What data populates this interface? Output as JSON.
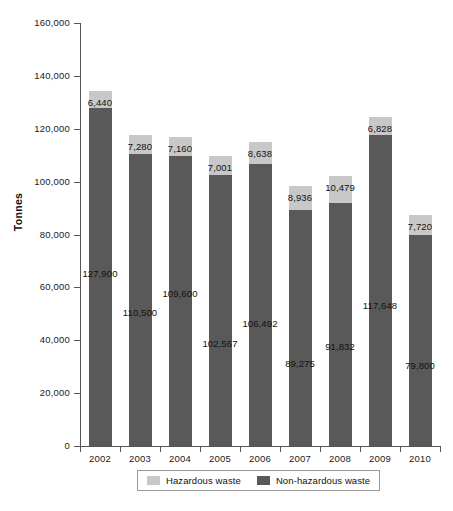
{
  "chart_data": {
    "type": "bar",
    "stacked": true,
    "title": "",
    "subtitle": "",
    "xlabel": "",
    "ylabel": "Tonnes",
    "ylim": [
      0,
      160000
    ],
    "ytick_values": [
      0,
      20000,
      40000,
      60000,
      80000,
      100000,
      120000,
      140000,
      160000
    ],
    "ytick_labels": [
      "0",
      "20,000",
      "40,000",
      "60,000",
      "80,000",
      "100,000",
      "120,000",
      "140,000",
      "160,000"
    ],
    "grid": false,
    "legend_position": "bottom",
    "categories": [
      "2002",
      "2003",
      "2004",
      "2005",
      "2006",
      "2007",
      "2008",
      "2009",
      "2010"
    ],
    "series": [
      {
        "name": "Non-hazardous waste",
        "color": "#595959",
        "values": [
          127900,
          110500,
          109600,
          102567,
          106492,
          89275,
          91832,
          117648,
          79800
        ],
        "labels": [
          "127,900",
          "110,500",
          "109,600",
          "102,567",
          "106,492",
          "89,275",
          "91,832",
          "117,648",
          "79,800"
        ]
      },
      {
        "name": "Hazardous waste",
        "color": "#c8c8c8",
        "values": [
          6440,
          7280,
          7160,
          7001,
          8638,
          8936,
          10479,
          6828,
          7720
        ],
        "labels": [
          "6,440",
          "7,280",
          "7,160",
          "7,001",
          "8,638",
          "8,936",
          "10,479",
          "6,828",
          "7,720"
        ]
      }
    ]
  },
  "legend": {
    "entries": [
      {
        "label": "Hazardous waste",
        "color": "#c8c8c8"
      },
      {
        "label": "Non-hazardous waste",
        "color": "#595959"
      }
    ]
  },
  "axis": {
    "y_title": "Tonnes"
  }
}
